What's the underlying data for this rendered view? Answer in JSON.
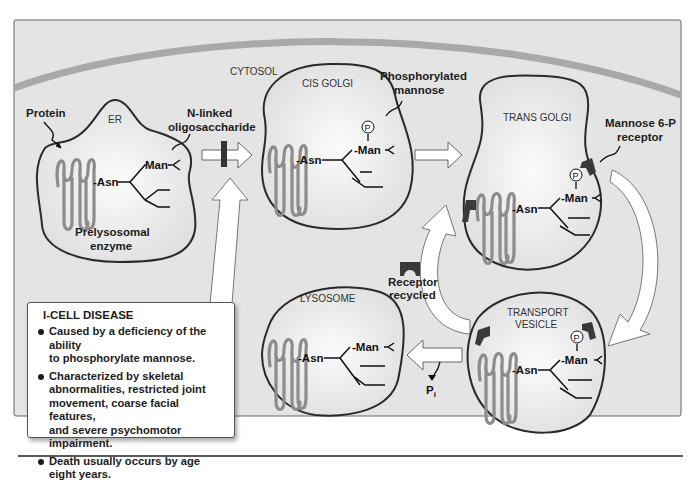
{
  "diagram": {
    "colors": {
      "background_panel": "#e4e4e4",
      "membrane_band": "#a9a9a9",
      "organelle_outline": "#2a2a2a",
      "protein_coil": "#8c8c8c",
      "receptor": "#3a3a3a",
      "arrow_fill": "#ffffff",
      "text": "#1c1c1c"
    },
    "region_label": "CYTOSOL",
    "compartments": {
      "er": {
        "label": "ER"
      },
      "cis_golgi": {
        "label": "CIS GOLGI"
      },
      "trans_golgi": {
        "label": "TRANS GOLGI"
      },
      "transport_vesicle": {
        "label_line1": "TRANSPORT",
        "label_line2": "VESICLE"
      },
      "lysosome": {
        "label": "LYSOSOME"
      }
    },
    "chem": {
      "asn": "Asn",
      "man": "Man",
      "phosphate": "P",
      "pi": "P",
      "pi_sub": "i"
    },
    "annotations": {
      "protein": "Protein",
      "n_linked_line1": "N-linked",
      "n_linked_line2": "oligosaccharide",
      "prelysosomal_line1": "Prelysosomal",
      "prelysosomal_line2": "enzyme",
      "phosphorylated_line1": "Phosphorylated",
      "phosphorylated_line2": "mannose",
      "m6p_line1": "Mannose 6-P",
      "m6p_line2": "receptor",
      "recycled_line1": "Receptor",
      "recycled_line2": "recycled"
    },
    "info_box": {
      "title": "I-CELL DISEASE",
      "bullets": [
        {
          "line1": "Caused by a deficiency of the ability",
          "line2": "to phosphorylate mannose."
        },
        {
          "line1": "Characterized by skeletal",
          "line2": "abnormalities, restricted joint",
          "line3": "movement, coarse facial features,",
          "line4": "and severe psychomotor impairment."
        },
        {
          "line1": "Death usually occurs by age",
          "line2": "eight years."
        }
      ]
    }
  }
}
